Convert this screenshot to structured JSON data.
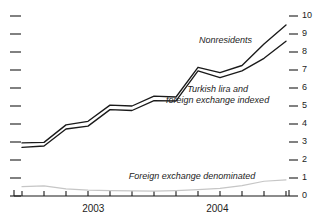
{
  "chart_data": {
    "type": "line",
    "title": "",
    "xlabel": "",
    "ylabel": "",
    "ylim": [
      0,
      10
    ],
    "y_ticks": [
      "0",
      "1",
      "2",
      "3",
      "4",
      "5",
      "6",
      "7",
      "8",
      "9",
      "10"
    ],
    "y_axis_position": "right",
    "left_axis_ticks_unlabeled": 11,
    "grid": false,
    "legend": "inline-annotations",
    "x_tick_count": 13,
    "x_categories": [
      "2003-01",
      "2003-03",
      "2003-05",
      "2003-07",
      "2003-09",
      "2003-11",
      "2004-01",
      "2004-03",
      "2004-05",
      "2004-07",
      "2004-09",
      "2004-11",
      "2005-01"
    ],
    "x_year_labels": [
      {
        "label": "2003",
        "center_fraction": 0.27
      },
      {
        "label": "2004",
        "center_fraction": 0.74
      }
    ],
    "series": [
      {
        "name": "Nonresidents",
        "color": "#1a1a1a",
        "values": [
          2.95,
          2.98,
          3.95,
          4.15,
          5.05,
          5.0,
          5.55,
          5.5,
          7.15,
          6.85,
          7.25,
          8.45,
          9.5
        ]
      },
      {
        "name": "Turkish lira and foreign exchange indexed",
        "color": "#1a1a1a",
        "values": [
          2.7,
          2.78,
          3.72,
          3.88,
          4.8,
          4.75,
          5.3,
          5.28,
          6.95,
          6.58,
          6.95,
          7.65,
          8.6
        ]
      },
      {
        "name": "Foreign exchange denominated",
        "color": "#c6c6c6",
        "values": [
          0.52,
          0.56,
          0.4,
          0.33,
          0.3,
          0.28,
          0.27,
          0.3,
          0.35,
          0.42,
          0.58,
          0.82,
          0.9
        ]
      }
    ],
    "annotations": [
      {
        "name": "nonresidents-label",
        "text": "Nonresidents",
        "x_pct": 70.5,
        "y_pct": 18.0
      },
      {
        "name": "tl-fx-indexed-label",
        "text_line1": "Turkish lira and",
        "text_line2": "foreign exchange indexed",
        "x_pct": 68.0,
        "y_pct": 42.5
      },
      {
        "name": "fx-denominated-label",
        "text": "Foreign exchange denominated",
        "x_pct": 60.0,
        "y_pct": 79.0
      }
    ]
  },
  "colors": {
    "line_dark": "#1a1a1a",
    "line_light": "#c6c6c6",
    "axis": "#1a1a1a",
    "background": "#ffffff"
  }
}
